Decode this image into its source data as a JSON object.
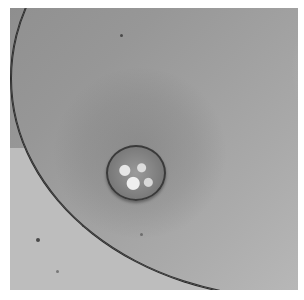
{
  "image": {
    "description": "Grayscale clinical photograph of skin with a rounded, irregular, crusted lesion centered within a darker areola region; curved skin fold boundary runs along the lower left.",
    "palette": {
      "skin_dark": "#8e8e8e",
      "skin_light": "#d0d0d0",
      "fold_line": "#2b2b2b",
      "lesion_border": "#3a3a3a",
      "lesion_highlight": "#e6e6e6",
      "background": "#ffffff"
    }
  }
}
